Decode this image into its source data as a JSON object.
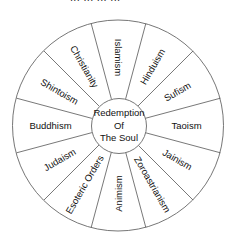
{
  "header": {
    "clipped_text": "... ... ... ..."
  },
  "diagram": {
    "type": "wheel",
    "center_label_lines": [
      "Redemption",
      "Of",
      "The Soul"
    ],
    "segments": [
      {
        "label": "Islamism",
        "angle": 0,
        "rotate": 90
      },
      {
        "label": "Hinduism",
        "angle": 30,
        "rotate": -60
      },
      {
        "label": "Sufism",
        "angle": 60,
        "rotate": -30
      },
      {
        "label": "Taoism",
        "angle": 90,
        "rotate": 0
      },
      {
        "label": "Jainism",
        "angle": 120,
        "rotate": 30
      },
      {
        "label": "Zoroastrianism",
        "angle": 150,
        "rotate": 60
      },
      {
        "label": "Animism",
        "angle": 180,
        "rotate": -90
      },
      {
        "label": "Esoteric Orders",
        "angle": 210,
        "rotate": -60
      },
      {
        "label": "Judaism",
        "angle": 240,
        "rotate": -30
      },
      {
        "label": "Buddhism",
        "angle": 270,
        "rotate": 0
      },
      {
        "label": "Shintoism",
        "angle": 300,
        "rotate": 30
      },
      {
        "label": "Christianity",
        "angle": 330,
        "rotate": 60
      }
    ],
    "colors": {
      "line": "#555555",
      "text": "#111111",
      "background": "#ffffff"
    }
  }
}
